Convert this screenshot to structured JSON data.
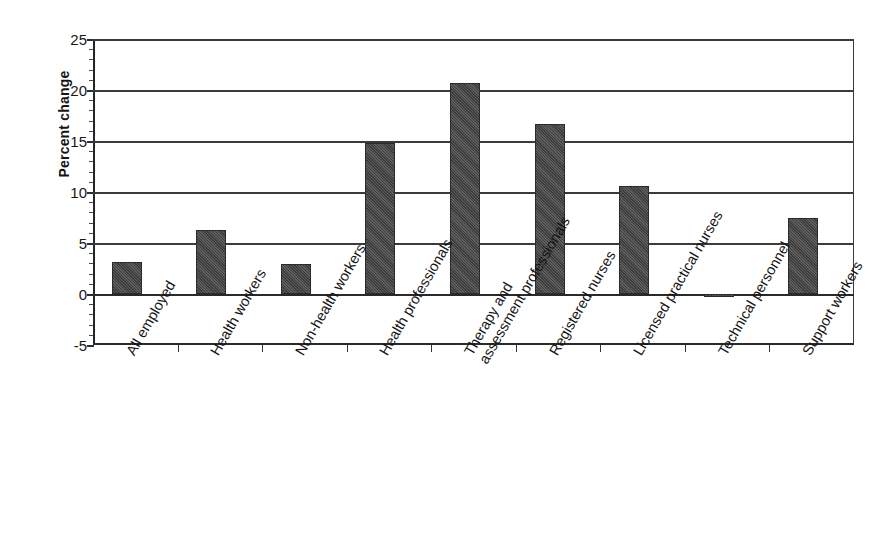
{
  "chart_data": {
    "type": "bar",
    "title": "",
    "subtitle": "",
    "xlabel": "",
    "ylabel": "Percent change",
    "ylim": [
      -5,
      25
    ],
    "ytick_values": [
      -5,
      0,
      5,
      10,
      15,
      20,
      25
    ],
    "ytick_labels": [
      "-5",
      "0",
      "5",
      "10",
      "15",
      "20",
      "25"
    ],
    "grid": true,
    "gridlines_at": [
      25,
      20,
      15,
      10,
      5,
      0
    ],
    "legend": null,
    "legend_position": "none",
    "bar_color": "#4d4d4d",
    "categories": [
      "All employed",
      "Health workers",
      "Non-health workers",
      "Health professionals",
      "Therapy and assessment professionals",
      "Registered nurses",
      "Licensed practical nurses",
      "Technical personnel",
      "Support workers"
    ],
    "category_lines": [
      [
        "All employed"
      ],
      [
        "Health workers"
      ],
      [
        "Non-health workers"
      ],
      [
        "Health professionals"
      ],
      [
        "Therapy and",
        "assessment professionals"
      ],
      [
        "Registered nurses"
      ],
      [
        "Licensed practical nurses"
      ],
      [
        "Technical personnel"
      ],
      [
        "Support workers"
      ]
    ],
    "values": [
      3.1,
      6.3,
      2.9,
      14.8,
      20.7,
      16.7,
      10.6,
      -0.3,
      7.5
    ]
  },
  "axis": {
    "y_title": "Percent change"
  }
}
